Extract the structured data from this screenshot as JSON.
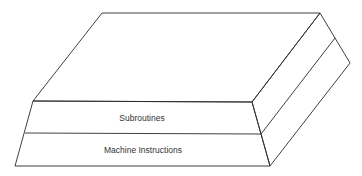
{
  "diagram": {
    "type": "layered-slab",
    "layers": [
      {
        "label": "Subroutines",
        "position": "upper"
      },
      {
        "label": "Machine Instructions",
        "position": "lower"
      }
    ],
    "colors": {
      "stroke": "#2a2a2a",
      "text": "#333333",
      "background": "#ffffff"
    }
  }
}
